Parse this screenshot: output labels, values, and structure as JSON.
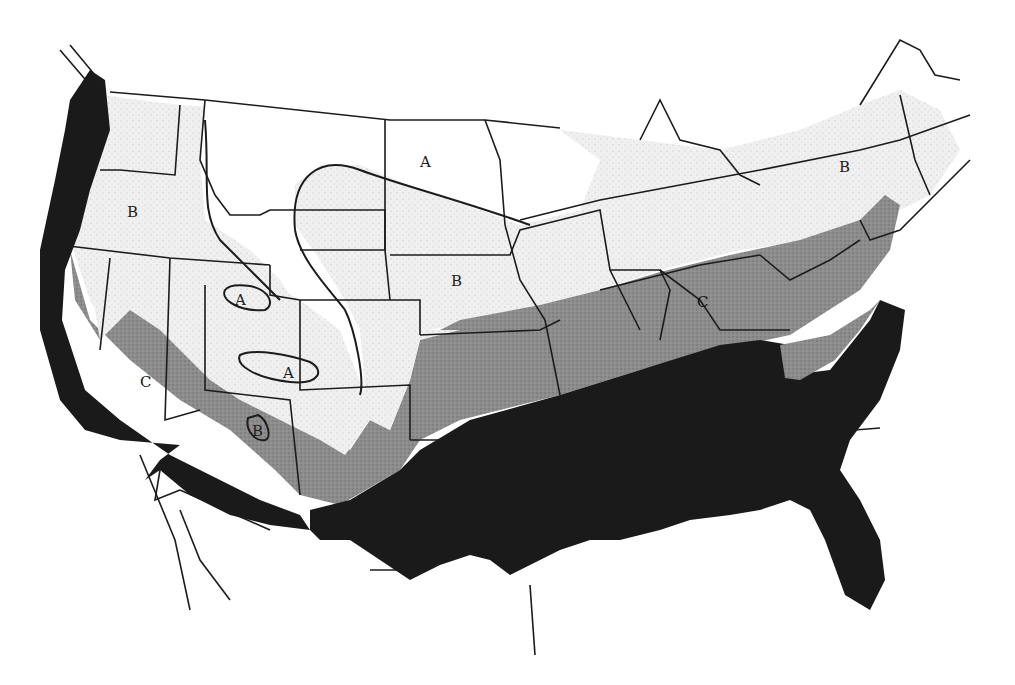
{
  "map": {
    "description": "Climate zone map of the contiguous United States",
    "zone_colors": {
      "A": "#ffffff",
      "B": "#ececec",
      "C": "#8a8a8a",
      "D": "#1a1a1a"
    },
    "labels": [
      {
        "id": "a-north-dakota",
        "text": "A",
        "x": 426,
        "y": 167
      },
      {
        "id": "b-oregon",
        "text": "B",
        "x": 133,
        "y": 217
      },
      {
        "id": "a-utah-north",
        "text": "A",
        "x": 241,
        "y": 304
      },
      {
        "id": "a-utah-south",
        "text": "A",
        "x": 289,
        "y": 377
      },
      {
        "id": "b-kansas",
        "text": "B",
        "x": 457,
        "y": 284
      },
      {
        "id": "b-arizona",
        "text": "B",
        "x": 258,
        "y": 435
      },
      {
        "id": "c-california",
        "text": "C",
        "x": 146,
        "y": 385
      },
      {
        "id": "c-tennessee",
        "text": "C",
        "x": 703,
        "y": 305
      },
      {
        "id": "b-new-york",
        "text": "B",
        "x": 845,
        "y": 170
      }
    ]
  }
}
